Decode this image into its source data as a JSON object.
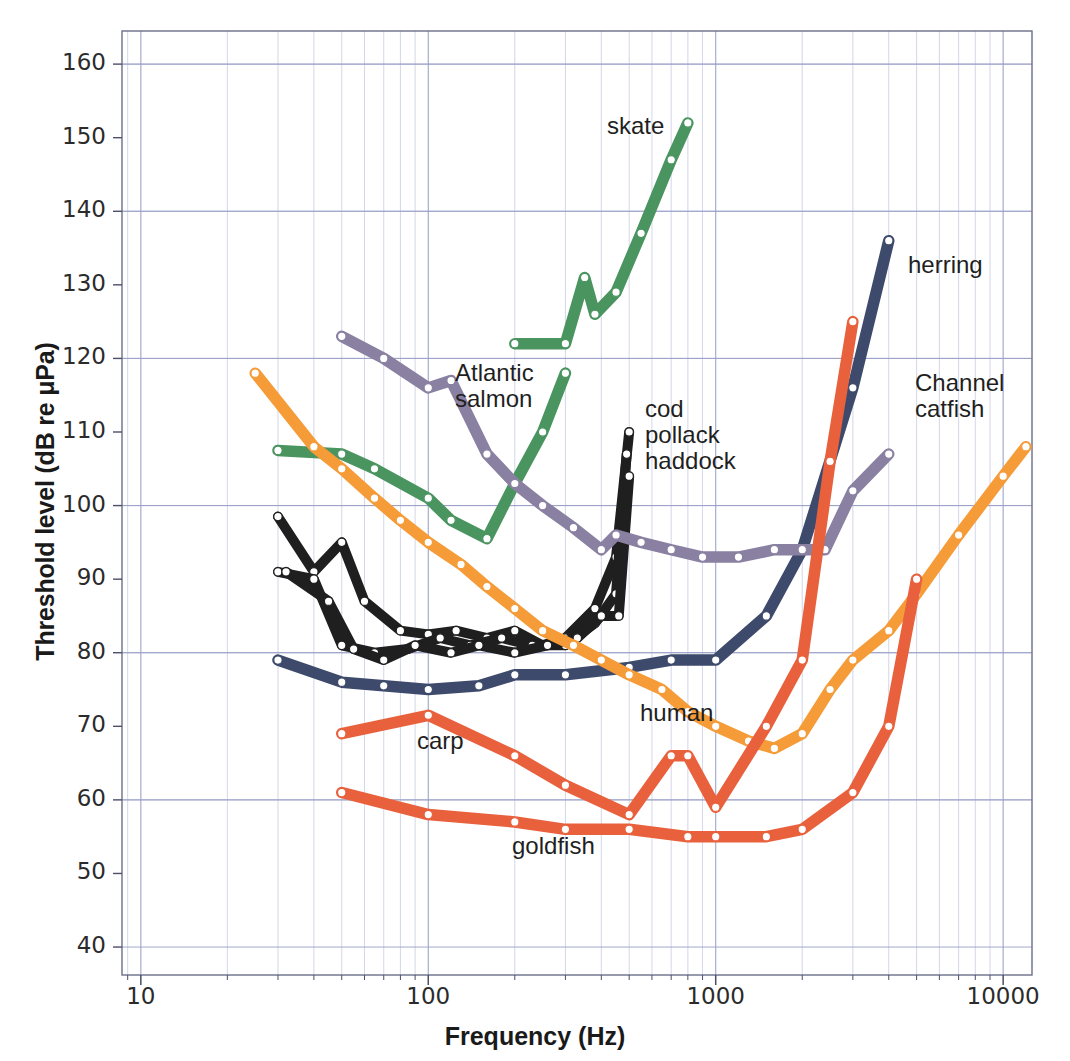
{
  "axes": {
    "ylabel": "Threshold level (dB re μPa)",
    "xlabel": "Frequency (Hz)",
    "yticks": [
      "40",
      "50",
      "60",
      "70",
      "80",
      "90",
      "100",
      "110",
      "120",
      "130",
      "140",
      "150",
      "160"
    ],
    "xticks": [
      "10",
      "100",
      "1000",
      "10000"
    ]
  },
  "labels": {
    "skate": "skate",
    "atlantic_salmon": "Atlantic\nsalmon",
    "cod_group": "cod\npollack\nhaddock",
    "herring": "herring",
    "channel_catfish": "Channel\ncatfish",
    "human": "human",
    "carp": "carp",
    "goldfish": "goldfish"
  },
  "colors": {
    "skate": "#4a9460",
    "atlantic_salmon": "#4a9460",
    "cod_group": "#1f1f1f",
    "herring": "#3e4a6b",
    "channel_catfish": "#8a80a2",
    "human": "#f59b38",
    "carp": "#e8613c",
    "goldfish": "#e8613c",
    "grid": "#b9bedb",
    "axis": "#6b6f8a",
    "marker": "#ffffff",
    "background": "#ffffff"
  },
  "chart_data": {
    "type": "line",
    "title": "",
    "xlabel": "Frequency (Hz)",
    "ylabel": "Threshold level (dB re μPa)",
    "xscale": "log",
    "xlim": [
      8.5,
      13000
    ],
    "ylim": [
      36,
      165
    ],
    "grid": true,
    "legend": "inline-annotations",
    "series": [
      {
        "name": "skate",
        "color": "#4a9460",
        "points": [
          [
            200,
            122
          ],
          [
            300,
            122
          ],
          [
            350,
            131
          ],
          [
            380,
            126
          ],
          [
            450,
            129
          ],
          [
            550,
            137
          ],
          [
            700,
            147
          ],
          [
            800,
            152
          ]
        ]
      },
      {
        "name": "Atlantic salmon",
        "color": "#4a9460",
        "points": [
          [
            30,
            107.5
          ],
          [
            50,
            107
          ],
          [
            65,
            105
          ],
          [
            100,
            101
          ],
          [
            120,
            98
          ],
          [
            160,
            95.5
          ],
          [
            200,
            103
          ],
          [
            250,
            110
          ],
          [
            300,
            118
          ]
        ]
      },
      {
        "name": "cod pollack haddock",
        "color": "#1f1f1f",
        "subseries": [
          {
            "name": "cod",
            "points": [
              [
                30,
                98.5
              ],
              [
                40,
                91
              ],
              [
                50,
                95
              ],
              [
                60,
                87
              ],
              [
                80,
                83
              ],
              [
                100,
                82.5
              ],
              [
                125,
                83
              ],
              [
                160,
                82
              ],
              [
                200,
                83
              ],
              [
                250,
                81
              ],
              [
                300,
                82
              ],
              [
                380,
                86
              ],
              [
                450,
                93
              ],
              [
                500,
                110
              ]
            ]
          },
          {
            "name": "pollack",
            "points": [
              [
                30,
                91
              ],
              [
                40,
                90
              ],
              [
                50,
                81
              ],
              [
                65,
                80
              ],
              [
                85,
                80.5
              ],
              [
                110,
                82
              ],
              [
                140,
                81
              ],
              [
                180,
                82
              ],
              [
                230,
                81
              ],
              [
                300,
                81
              ],
              [
                380,
                84
              ],
              [
                450,
                88
              ],
              [
                490,
                107
              ]
            ]
          },
          {
            "name": "haddock",
            "points": [
              [
                32,
                91
              ],
              [
                45,
                87
              ],
              [
                55,
                80.5
              ],
              [
                70,
                79
              ],
              [
                90,
                81
              ],
              [
                120,
                80
              ],
              [
                150,
                81
              ],
              [
                200,
                80
              ],
              [
                260,
                81
              ],
              [
                330,
                82
              ],
              [
                400,
                85
              ],
              [
                460,
                85
              ],
              [
                500,
                104
              ]
            ]
          }
        ]
      },
      {
        "name": "herring",
        "color": "#3e4a6b",
        "points": [
          [
            30,
            79
          ],
          [
            50,
            76
          ],
          [
            70,
            75.5
          ],
          [
            100,
            75
          ],
          [
            150,
            75.5
          ],
          [
            200,
            77
          ],
          [
            300,
            77
          ],
          [
            500,
            78
          ],
          [
            700,
            79
          ],
          [
            1000,
            79
          ],
          [
            1500,
            85
          ],
          [
            2000,
            94
          ],
          [
            3000,
            116
          ],
          [
            4000,
            136
          ]
        ]
      },
      {
        "name": "Channel catfish",
        "color": "#8a80a2",
        "points": [
          [
            50,
            123
          ],
          [
            70,
            120
          ],
          [
            100,
            116
          ],
          [
            120,
            117
          ],
          [
            160,
            107
          ],
          [
            200,
            103
          ],
          [
            250,
            100
          ],
          [
            320,
            97
          ],
          [
            400,
            94
          ],
          [
            450,
            96
          ],
          [
            550,
            95
          ],
          [
            700,
            94
          ],
          [
            900,
            93
          ],
          [
            1200,
            93
          ],
          [
            1600,
            94
          ],
          [
            2000,
            94
          ],
          [
            2400,
            94
          ],
          [
            3000,
            102
          ],
          [
            4000,
            107
          ]
        ]
      },
      {
        "name": "human",
        "color": "#f59b38",
        "points": [
          [
            25,
            118
          ],
          [
            40,
            108
          ],
          [
            50,
            105
          ],
          [
            65,
            101
          ],
          [
            80,
            98
          ],
          [
            100,
            95
          ],
          [
            130,
            92
          ],
          [
            160,
            89
          ],
          [
            200,
            86
          ],
          [
            250,
            83
          ],
          [
            320,
            81
          ],
          [
            400,
            79
          ],
          [
            500,
            77
          ],
          [
            650,
            75
          ],
          [
            800,
            72
          ],
          [
            1000,
            70
          ],
          [
            1300,
            68
          ],
          [
            1600,
            67
          ],
          [
            2000,
            69
          ],
          [
            2500,
            75
          ],
          [
            3000,
            79
          ],
          [
            4000,
            83
          ],
          [
            5000,
            88
          ],
          [
            7000,
            96
          ],
          [
            10000,
            104
          ],
          [
            12000,
            108
          ]
        ]
      },
      {
        "name": "carp",
        "color": "#e8613c",
        "points": [
          [
            50,
            69
          ],
          [
            100,
            71.5
          ],
          [
            200,
            66
          ],
          [
            300,
            62
          ],
          [
            500,
            58
          ],
          [
            700,
            66
          ],
          [
            800,
            66
          ],
          [
            1000,
            59
          ],
          [
            1500,
            70
          ],
          [
            2000,
            79
          ],
          [
            2500,
            106
          ],
          [
            3000,
            125
          ]
        ]
      },
      {
        "name": "goldfish",
        "color": "#e8613c",
        "points": [
          [
            50,
            61
          ],
          [
            100,
            58
          ],
          [
            200,
            57
          ],
          [
            300,
            56
          ],
          [
            500,
            56
          ],
          [
            800,
            55
          ],
          [
            1000,
            55
          ],
          [
            1500,
            55
          ],
          [
            2000,
            56
          ],
          [
            3000,
            61
          ],
          [
            4000,
            70
          ],
          [
            5000,
            90
          ]
        ]
      }
    ]
  }
}
